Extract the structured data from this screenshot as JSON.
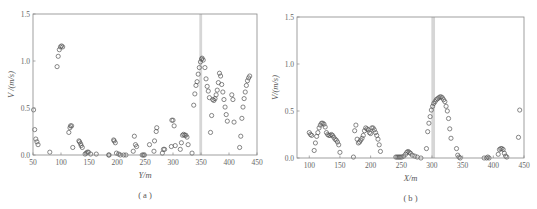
{
  "chart_data": [
    {
      "id": "a",
      "type": "scatter",
      "caption": "( a )",
      "xlabel": "Y/m",
      "ylabel": "V /(m/s)",
      "xlim": [
        50,
        450
      ],
      "ylim": [
        0,
        1.5
      ],
      "xticks": [
        50,
        100,
        150,
        200,
        250,
        300,
        350,
        400,
        450
      ],
      "yticks": [
        0.0,
        0.5,
        1.0,
        1.5
      ],
      "ytick_labels": [
        "0.0",
        "0.5",
        "1.0",
        "1.5"
      ],
      "shaded_band": [
        347,
        352
      ],
      "grid": false,
      "frame": {
        "left": 33,
        "top": 14,
        "right": 257,
        "bottom": 155
      },
      "points": [
        [
          51,
          0.48
        ],
        [
          53,
          0.27
        ],
        [
          55,
          0.17
        ],
        [
          57,
          0.14
        ],
        [
          59,
          0.11
        ],
        [
          80,
          0.03
        ],
        [
          93,
          0.94
        ],
        [
          95,
          1.05
        ],
        [
          97,
          1.12
        ],
        [
          99,
          1.15
        ],
        [
          101,
          1.16
        ],
        [
          103,
          1.15
        ],
        [
          114,
          0.24
        ],
        [
          116,
          0.29
        ],
        [
          117,
          0.31
        ],
        [
          119,
          0.31
        ],
        [
          121,
          0.08
        ],
        [
          132,
          0.15
        ],
        [
          133,
          0.14
        ],
        [
          135,
          0.12
        ],
        [
          136,
          0.1
        ],
        [
          138,
          0.08
        ],
        [
          143,
          0.01
        ],
        [
          145,
          0.02
        ],
        [
          147,
          0.03
        ],
        [
          149,
          0.03
        ],
        [
          153,
          0.01
        ],
        [
          163,
          0.01
        ],
        [
          185,
          0.0
        ],
        [
          186,
          0.0
        ],
        [
          194,
          0.16
        ],
        [
          195,
          0.15
        ],
        [
          197,
          0.13
        ],
        [
          199,
          0.02
        ],
        [
          203,
          0.01
        ],
        [
          206,
          0.0
        ],
        [
          212,
          0.0
        ],
        [
          216,
          0.0
        ],
        [
          229,
          0.04
        ],
        [
          231,
          0.2
        ],
        [
          233,
          0.11
        ],
        [
          235,
          0.09
        ],
        [
          245,
          0.0
        ],
        [
          247,
          0.0
        ],
        [
          249,
          0.0
        ],
        [
          258,
          0.11
        ],
        [
          266,
          0.04
        ],
        [
          267,
          0.15
        ],
        [
          270,
          0.25
        ],
        [
          271,
          0.29
        ],
        [
          281,
          0.02
        ],
        [
          283,
          0.06
        ],
        [
          285,
          0.06
        ],
        [
          297,
          0.09
        ],
        [
          298,
          0.37
        ],
        [
          300,
          0.37
        ],
        [
          302,
          0.31
        ],
        [
          304,
          0.1
        ],
        [
          313,
          0.06
        ],
        [
          315,
          0.13
        ],
        [
          317,
          0.21
        ],
        [
          319,
          0.22
        ],
        [
          321,
          0.21
        ],
        [
          323,
          0.21
        ],
        [
          325,
          0.19
        ],
        [
          327,
          0.11
        ],
        [
          334,
          0.02
        ],
        [
          337,
          0.53
        ],
        [
          339,
          0.65
        ],
        [
          341,
          0.74
        ],
        [
          343,
          0.78
        ],
        [
          345,
          0.86
        ],
        [
          347,
          0.93
        ],
        [
          349,
          0.99
        ],
        [
          351,
          1.02
        ],
        [
          352,
          1.03
        ],
        [
          354,
          1.01
        ],
        [
          357,
          0.93
        ],
        [
          359,
          0.81
        ],
        [
          361,
          0.73
        ],
        [
          363,
          0.68
        ],
        [
          365,
          0.61
        ],
        [
          367,
          0.24
        ],
        [
          369,
          0.42
        ],
        [
          371,
          0.59
        ],
        [
          373,
          0.58
        ],
        [
          375,
          0.6
        ],
        [
          377,
          0.64
        ],
        [
          379,
          0.69
        ],
        [
          381,
          0.77
        ],
        [
          383,
          0.87
        ],
        [
          385,
          0.84
        ],
        [
          387,
          0.75
        ],
        [
          389,
          0.67
        ],
        [
          391,
          0.59
        ],
        [
          393,
          0.51
        ],
        [
          395,
          0.43
        ],
        [
          397,
          0.36
        ],
        [
          405,
          0.64
        ],
        [
          407,
          0.59
        ],
        [
          409,
          0.35
        ],
        [
          419,
          0.08
        ],
        [
          421,
          0.2
        ],
        [
          423,
          0.39
        ],
        [
          425,
          0.51
        ],
        [
          427,
          0.6
        ],
        [
          429,
          0.67
        ],
        [
          431,
          0.74
        ],
        [
          433,
          0.79
        ],
        [
          435,
          0.82
        ],
        [
          437,
          0.84
        ]
      ]
    },
    {
      "id": "b",
      "type": "scatter",
      "caption": "( b )",
      "xlabel": "X/m",
      "ylabel": "V/(m/s)",
      "xlim": [
        80,
        450
      ],
      "ylim": [
        0,
        1.5
      ],
      "xticks": [
        100,
        150,
        200,
        250,
        300,
        350,
        400,
        450
      ],
      "yticks": [
        0.0,
        0.5,
        1.0,
        1.5
      ],
      "ytick_labels": [
        "0.0",
        "0.5",
        "1.0",
        "1.5"
      ],
      "shaded_band": [
        299,
        305
      ],
      "grid": false,
      "frame": {
        "left": 297,
        "top": 17,
        "right": 524,
        "bottom": 158
      },
      "points": [
        [
          100,
          0.27
        ],
        [
          102,
          0.25
        ],
        [
          104,
          0.24
        ],
        [
          108,
          0.08
        ],
        [
          110,
          0.16
        ],
        [
          112,
          0.23
        ],
        [
          114,
          0.27
        ],
        [
          116,
          0.32
        ],
        [
          118,
          0.35
        ],
        [
          120,
          0.37
        ],
        [
          122,
          0.37
        ],
        [
          124,
          0.36
        ],
        [
          126,
          0.33
        ],
        [
          128,
          0.27
        ],
        [
          130,
          0.25
        ],
        [
          132,
          0.24
        ],
        [
          134,
          0.24
        ],
        [
          136,
          0.25
        ],
        [
          138,
          0.24
        ],
        [
          140,
          0.22
        ],
        [
          142,
          0.2
        ],
        [
          144,
          0.19
        ],
        [
          146,
          0.17
        ],
        [
          148,
          0.14
        ],
        [
          150,
          0.06
        ],
        [
          172,
          0.01
        ],
        [
          174,
          0.29
        ],
        [
          176,
          0.35
        ],
        [
          178,
          0.2
        ],
        [
          180,
          0.16
        ],
        [
          182,
          0.17
        ],
        [
          184,
          0.19
        ],
        [
          186,
          0.21
        ],
        [
          188,
          0.24
        ],
        [
          190,
          0.29
        ],
        [
          192,
          0.32
        ],
        [
          194,
          0.31
        ],
        [
          196,
          0.3
        ],
        [
          198,
          0.27
        ],
        [
          200,
          0.26
        ],
        [
          202,
          0.32
        ],
        [
          204,
          0.32
        ],
        [
          206,
          0.3
        ],
        [
          208,
          0.27
        ],
        [
          210,
          0.24
        ],
        [
          212,
          0.2
        ],
        [
          214,
          0.14
        ],
        [
          216,
          0.07
        ],
        [
          241,
          0.01
        ],
        [
          243,
          0.01
        ],
        [
          245,
          0.01
        ],
        [
          247,
          0.01
        ],
        [
          249,
          0.01
        ],
        [
          251,
          0.01
        ],
        [
          254,
          0.02
        ],
        [
          257,
          0.04
        ],
        [
          259,
          0.06
        ],
        [
          261,
          0.07
        ],
        [
          263,
          0.06
        ],
        [
          265,
          0.05
        ],
        [
          268,
          0.03
        ],
        [
          272,
          0.02
        ],
        [
          276,
          0.01
        ],
        [
          282,
          0.0
        ],
        [
          291,
          0.1
        ],
        [
          293,
          0.28
        ],
        [
          295,
          0.37
        ],
        [
          297,
          0.44
        ],
        [
          299,
          0.51
        ],
        [
          301,
          0.55
        ],
        [
          303,
          0.58
        ],
        [
          305,
          0.6
        ],
        [
          307,
          0.62
        ],
        [
          309,
          0.63
        ],
        [
          311,
          0.64
        ],
        [
          313,
          0.65
        ],
        [
          315,
          0.65
        ],
        [
          317,
          0.64
        ],
        [
          319,
          0.62
        ],
        [
          321,
          0.6
        ],
        [
          323,
          0.55
        ],
        [
          325,
          0.5
        ],
        [
          327,
          0.42
        ],
        [
          329,
          0.31
        ],
        [
          331,
          0.21
        ],
        [
          340,
          0.1
        ],
        [
          342,
          0.03
        ],
        [
          344,
          0.01
        ],
        [
          346,
          0.0
        ],
        [
          385,
          0.0
        ],
        [
          389,
          0.0
        ],
        [
          391,
          0.01
        ],
        [
          393,
          0.0
        ],
        [
          408,
          0.04
        ],
        [
          410,
          0.09
        ],
        [
          412,
          0.1
        ],
        [
          414,
          0.1
        ],
        [
          416,
          0.09
        ],
        [
          418,
          0.05
        ],
        [
          420,
          0.02
        ],
        [
          422,
          0.01
        ],
        [
          441,
          0.22
        ],
        [
          443,
          0.51
        ]
      ]
    }
  ],
  "colors": {
    "marker": "#555555",
    "axis": "#888888",
    "band": "#d6d6d6"
  }
}
